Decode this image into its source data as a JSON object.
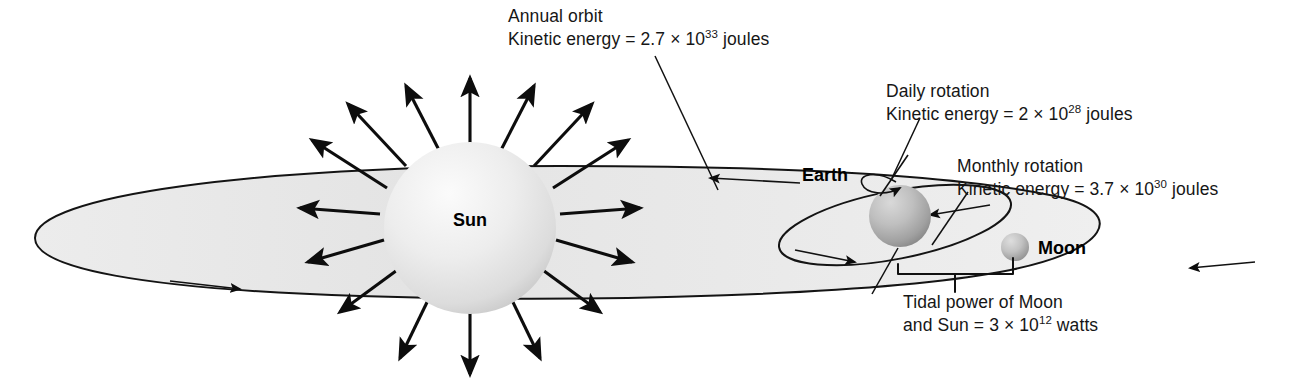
{
  "diagram": {
    "background_color": "#ffffff",
    "ink_color": "#111111"
  },
  "bodies": {
    "sun": {
      "label": "Sun",
      "cx": 470,
      "cy": 228,
      "r": 86,
      "fill_light": "#f2f2f2",
      "fill_dark": "#c9c9c9"
    },
    "earth": {
      "label": "Earth",
      "cx": 900,
      "cy": 216,
      "r": 31,
      "fill_light": "#c6c6c6",
      "fill_dark": "#8e8e8e"
    },
    "moon": {
      "label": "Moon",
      "cx": 1015,
      "cy": 247,
      "r": 14,
      "fill_light": "#cfcfcf",
      "fill_dark": "#949494"
    }
  },
  "annotations": {
    "annual_orbit": {
      "line1": "Annual orbit",
      "line2_prefix": "Kinetic energy = 2.7 × 10",
      "line2_exponent": "33",
      "line2_suffix": " joules",
      "x": 508,
      "y": 22
    },
    "daily_rotation": {
      "line1": "Daily rotation",
      "line2_prefix": "Kinetic energy = 2 × 10",
      "line2_exponent": "28",
      "line2_suffix": " joules",
      "x": 886,
      "y": 97
    },
    "monthly_rotation": {
      "line1": "Monthly rotation",
      "line2_prefix": "Kinetic energy = 3.7 × 10",
      "line2_exponent": "30",
      "line2_suffix": " joules",
      "x": 957,
      "y": 172
    },
    "tidal_power": {
      "line1": "Tidal power of Moon",
      "line2_prefix": "and Sun = 3 × 10",
      "line2_exponent": "12",
      "line2_suffix": " watts",
      "x": 903,
      "y": 308
    }
  },
  "orbits": {
    "annual_orbit_name": "earth-annual-orbit-ellipse",
    "monthly_orbit_name": "moon-monthly-orbit-ellipse",
    "fill": "#e8e8e8"
  }
}
